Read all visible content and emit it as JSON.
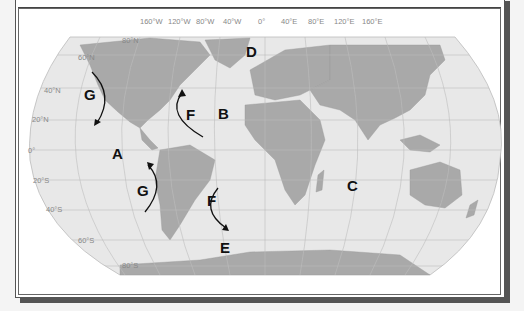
{
  "map": {
    "projection": "Robinson world map with ocean currents",
    "longitude_labels": [
      "160°W",
      "120°W",
      "80°W",
      "40°W",
      "0°",
      "40°E",
      "80°E",
      "120°E",
      "160°E"
    ],
    "latitude_labels": [
      "80°N",
      "60°N",
      "40°N",
      "20°N",
      "0°",
      "20°S",
      "40°S",
      "60°S",
      "80°S"
    ],
    "location_labels": [
      {
        "id": "A",
        "label": "A"
      },
      {
        "id": "B",
        "label": "B"
      },
      {
        "id": "C",
        "label": "C"
      },
      {
        "id": "D",
        "label": "D"
      },
      {
        "id": "E",
        "label": "E"
      }
    ],
    "current_labels": [
      {
        "id": "G-north-pacific",
        "label": "G"
      },
      {
        "id": "G-south-pacific",
        "label": "G"
      },
      {
        "id": "F-north-atlantic",
        "label": "F"
      },
      {
        "id": "F-south-atlantic",
        "label": "F"
      }
    ],
    "colors": {
      "ocean": "#e6e6e6",
      "land": "#a9a9a9",
      "grid": "#b8b8b8",
      "label": "#111111",
      "frame_shadow": "#555555"
    }
  }
}
